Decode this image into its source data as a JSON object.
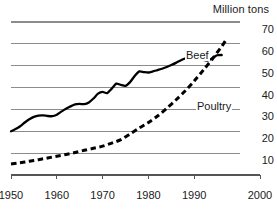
{
  "chart_data": {
    "type": "line",
    "title": "Million tons",
    "xlabel": "",
    "ylabel": "Million tons",
    "xlim": [
      1950,
      2000
    ],
    "ylim": [
      0,
      70
    ],
    "grid": true,
    "grid_axis": "y",
    "legend_position": "inline-annotation",
    "y_ticks": [
      70,
      60,
      50,
      40,
      30,
      20,
      10
    ],
    "y_tick_labels": [
      "70",
      "60",
      "50",
      "40",
      "30",
      "20",
      "10"
    ],
    "x_ticks": [
      1950,
      1960,
      1970,
      1980,
      1990,
      2000
    ],
    "x_tick_labels": [
      "1950",
      "1960",
      "1970",
      "1980",
      "1990",
      "2000"
    ],
    "colors": {
      "beef": "#000000",
      "poultry": "#000000",
      "grid": "#8c8c8c",
      "axis": "#555555",
      "background": "#ffffff"
    },
    "series": [
      {
        "name": "Beef",
        "style": "solid",
        "label_text": "Beef",
        "x": [
          1950,
          1951,
          1952,
          1953,
          1954,
          1955,
          1956,
          1957,
          1958,
          1959,
          1960,
          1961,
          1962,
          1963,
          1964,
          1965,
          1966,
          1967,
          1968,
          1969,
          1970,
          1971,
          1972,
          1973,
          1974,
          1975,
          1976,
          1977,
          1978,
          1979,
          1980,
          1981,
          1982,
          1983,
          1984,
          1985,
          1986,
          1987,
          1988,
          1989,
          1990,
          1991,
          1992,
          1993,
          1994,
          1995,
          1996
        ],
        "values": [
          20.0,
          21.0,
          22.3,
          24.0,
          25.5,
          26.6,
          27.2,
          27.3,
          27.0,
          26.9,
          27.6,
          29.0,
          30.3,
          31.4,
          32.3,
          32.5,
          32.4,
          33.2,
          35.0,
          37.2,
          38.0,
          37.5,
          39.5,
          41.8,
          41.2,
          40.8,
          42.5,
          45.3,
          47.4,
          47.1,
          46.9,
          47.4,
          48.0,
          48.6,
          49.4,
          50.3,
          51.3,
          52.4,
          53.3,
          53.9,
          54.1,
          53.5,
          52.7,
          52.4,
          53.5,
          54.8,
          54.9
        ]
      },
      {
        "name": "Poultry",
        "style": "dashed",
        "label_text": "Poultry",
        "x": [
          1950,
          1952,
          1954,
          1956,
          1958,
          1960,
          1962,
          1964,
          1966,
          1968,
          1970,
          1972,
          1974,
          1976,
          1978,
          1980,
          1982,
          1984,
          1986,
          1988,
          1990,
          1992,
          1994,
          1996,
          1997
        ],
        "values": [
          5.0,
          5.6,
          6.3,
          7.0,
          7.8,
          8.6,
          9.4,
          10.3,
          11.3,
          12.2,
          13.2,
          14.6,
          16.2,
          18.8,
          21.5,
          24.0,
          27.0,
          30.5,
          34.3,
          38.4,
          43.0,
          48.0,
          53.2,
          58.8,
          62.0
        ]
      }
    ],
    "annotations": [
      {
        "text": "Beef",
        "x": 1987,
        "y": 58
      },
      {
        "text": "Poultry",
        "x": 1989,
        "y": 37
      }
    ]
  }
}
